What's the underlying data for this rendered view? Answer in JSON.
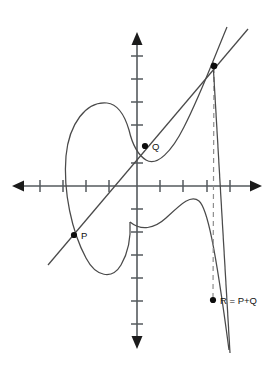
{
  "figure": {
    "background_color": "#ffffff",
    "width": 271,
    "height": 365,
    "axis_color": "#555a5e",
    "curve_color": "#4a4a4a",
    "dashed_color": "#8d8d8d",
    "point_color": "#0d0d0d"
  },
  "axes": {
    "origin": {
      "x": 137,
      "y": 186
    },
    "x_axis": {
      "name": "horizontal-axis",
      "from_x": 13,
      "to_x": 262,
      "y": 186,
      "arrow_left": true,
      "arrow_right": true,
      "tick_half_length": 6,
      "tick_positions": [
        40,
        63,
        86,
        109,
        160,
        183,
        207,
        230
      ]
    },
    "y_axis": {
      "name": "vertical-axis",
      "x": 137,
      "from_y": 33,
      "to_y": 348,
      "arrow_up": true,
      "arrow_down": true,
      "tick_half_length": 6,
      "tick_positions": [
        56,
        79,
        102,
        125,
        148,
        163,
        209,
        232,
        255,
        278,
        301,
        324
      ]
    }
  },
  "points": [
    {
      "id": "P",
      "label": "P",
      "name": "point-p",
      "cx": 74,
      "cy": 235,
      "r": 3.1,
      "label_x": 80,
      "label_y": 239
    },
    {
      "id": "Q",
      "label": "Q",
      "name": "point-q",
      "cx": 145,
      "cy": 146,
      "r": 3.1,
      "label_x": 151,
      "label_y": 150
    },
    {
      "id": "R",
      "label": "R = P+Q",
      "name": "point-r",
      "cx": 213,
      "cy": 300,
      "r": 3.1,
      "label_x": 219,
      "label_y": 304
    },
    {
      "id": "minusR",
      "label": "",
      "name": "point-minus-r-intersection",
      "cx": 214,
      "cy": 66,
      "r": 3.2,
      "label_x": 0,
      "label_y": 0
    }
  ],
  "paths": {
    "oval_component": "M 107 103 C 88 99 70 122 67 155 C 64 190 72 230 86 257 C 96 276 111 280 121 266 C 129 254 131 238 130 222",
    "branch_upper": "M 227 27 C 216 52 202 92 185 126 C 173 150 158 166 146 160 C 139 156 133 144 130 131",
    "branch_lower_left": "M 130 222 C 126 236 118 248 107 252 C 92 258 80 246 73 230",
    "branch_lower_right": "M 130 222 C 140 230 152 230 164 220 C 180 206 190 194 199 200 C 207 206 214 240 228 348",
    "secant_line": "M 48 265 L 247 30",
    "dashed_drop": "M 214 66 L 213 300",
    "tangent_tail": "M 214 66 L 229 352"
  },
  "labels": {
    "p": "P",
    "q": "Q",
    "r": "R = P+Q"
  }
}
